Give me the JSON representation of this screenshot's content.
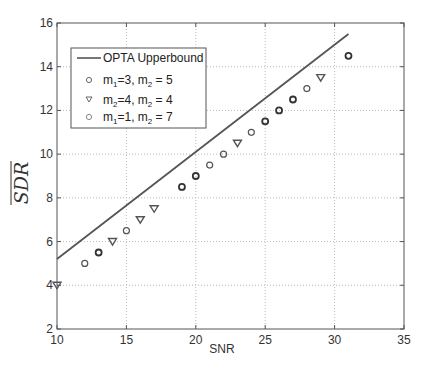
{
  "chart_data": {
    "type": "scatter",
    "title": "",
    "xlabel": "SNR",
    "ylabel": "SDR (overlined)",
    "xlim": [
      10,
      35
    ],
    "ylim": [
      2,
      16
    ],
    "xticks": [
      10,
      15,
      20,
      25,
      30,
      35
    ],
    "yticks": [
      2,
      4,
      6,
      8,
      10,
      12,
      14,
      16
    ],
    "grid": true,
    "legend_position": "upper left",
    "series": [
      {
        "name": "OPTA Upperbound",
        "kind": "line",
        "color": "#555555",
        "x": [
          10,
          31
        ],
        "y": [
          5.2,
          15.5
        ]
      },
      {
        "name": "m1=3, m2 = 5",
        "kind": "marker",
        "marker": "circle-bold",
        "color": "#333333",
        "x": [
          13,
          19,
          20,
          25,
          26,
          27,
          31
        ],
        "y": [
          5.5,
          8.5,
          9,
          11.5,
          12,
          12.5,
          14.5
        ]
      },
      {
        "name": "m2=4, m2 = 4",
        "kind": "marker",
        "marker": "triangle-down",
        "color": "#555555",
        "x": [
          10,
          14,
          16,
          17,
          23,
          29
        ],
        "y": [
          4,
          6,
          7,
          7.5,
          10.5,
          13.5
        ]
      },
      {
        "name": "m1=1, m2 = 7",
        "kind": "marker",
        "marker": "circle",
        "color": "#555555",
        "x": [
          12,
          15,
          21,
          22,
          24,
          28
        ],
        "y": [
          5,
          6.5,
          9.5,
          10,
          11,
          13
        ]
      }
    ]
  },
  "legend": {
    "items": [
      {
        "label": "OPTA Upperbound"
      },
      {
        "a": "m",
        "a_sub": "1",
        "a_val": "=3, ",
        "b": "m",
        "b_sub": "2",
        "b_val": " = 5"
      },
      {
        "a": "m",
        "a_sub": "2",
        "a_val": "=4, ",
        "b": "m",
        "b_sub": "2",
        "b_val": " = 4"
      },
      {
        "a": "m",
        "a_sub": "1",
        "a_val": "=1, ",
        "b": "m",
        "b_sub": "2",
        "b_val": " = 7"
      }
    ]
  },
  "axes": {
    "xlabel": "SNR",
    "ylabel": "SDR"
  }
}
